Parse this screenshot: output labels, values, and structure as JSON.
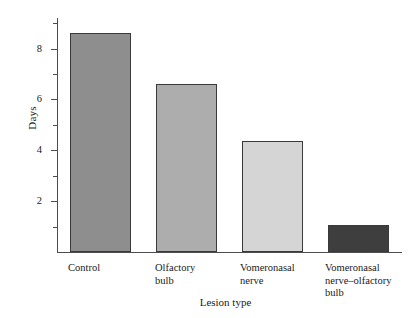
{
  "chart_data": {
    "type": "bar",
    "title": "",
    "xlabel": "Lesion type",
    "ylabel": "Days",
    "categories": [
      "Control",
      "Olfactory\nbulb",
      "Vomeronasal\nnerve",
      "Vomeronasal\nnerve–olfactory\nbulb"
    ],
    "values": [
      8.6,
      6.6,
      4.35,
      1.05
    ],
    "ylim": [
      0,
      9.2
    ],
    "yticks": [
      2,
      4,
      6,
      8
    ],
    "ytick_labels": [
      "2",
      "4",
      "6",
      "8"
    ],
    "yminor_ticks": [
      1,
      3,
      5,
      7,
      9
    ],
    "grid": false,
    "legend": null,
    "bar_colors": [
      "#8e8e8e",
      "#adadad",
      "#d5d5d5",
      "#3e3e3e"
    ],
    "bar_edge_color": "#3a3a3a",
    "axis_color": "#4d4d4d"
  },
  "axes": {
    "y_title": "Days",
    "x_title": "Lesion type"
  },
  "ytick_items": [
    {
      "label": "2",
      "value": 2
    },
    {
      "label": "4",
      "value": 4
    },
    {
      "label": "6",
      "value": 6
    },
    {
      "label": "8",
      "value": 8
    }
  ],
  "bars": [
    {
      "label": "Control",
      "value": 8.6,
      "color": "#8e8e8e"
    },
    {
      "label": "Olfactory\nbulb",
      "value": 6.6,
      "color": "#adadad"
    },
    {
      "label": "Vomeronasal\nnerve",
      "value": 4.35,
      "color": "#d5d5d5"
    },
    {
      "label": "Vomeronasal\nnerve–olfactory\nbulb",
      "value": 1.05,
      "color": "#3e3e3e"
    }
  ]
}
